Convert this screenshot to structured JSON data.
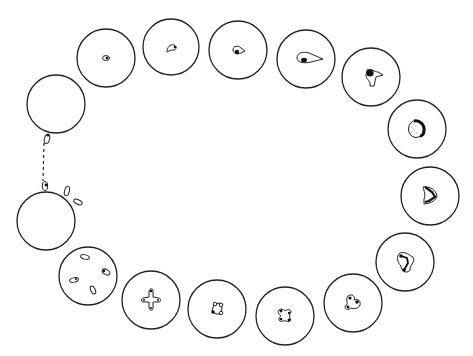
{
  "diagram": {
    "stroke_color": "#222222",
    "background": "#ffffff",
    "cells": [
      {
        "id": 1,
        "cx": 56,
        "cy": 104,
        "r": 29,
        "content": "empty-with-budding-body"
      },
      {
        "id": 2,
        "cx": 106,
        "cy": 58,
        "r": 29,
        "content": "small-nucleus"
      },
      {
        "id": 3,
        "cx": 171,
        "cy": 47,
        "r": 28,
        "content": "curved-nucleus"
      },
      {
        "id": 4,
        "cx": 238,
        "cy": 50,
        "r": 29,
        "content": "teardrop-nucleus"
      },
      {
        "id": 5,
        "cx": 306,
        "cy": 59,
        "r": 29,
        "content": "elongated-teardrop"
      },
      {
        "id": 6,
        "cx": 371,
        "cy": 77,
        "r": 29,
        "content": "trilobed-body"
      },
      {
        "id": 7,
        "cx": 417,
        "cy": 129,
        "r": 29,
        "content": "stippled-round-body"
      },
      {
        "id": 8,
        "cx": 430,
        "cy": 196,
        "r": 29,
        "content": "crescent-body"
      },
      {
        "id": 9,
        "cx": 405,
        "cy": 262,
        "r": 29,
        "content": "lobed-with-beads"
      },
      {
        "id": 10,
        "cx": 353,
        "cy": 303,
        "r": 29,
        "content": "trilobe-with-dots"
      },
      {
        "id": 11,
        "cx": 285,
        "cy": 316,
        "r": 29,
        "content": "x-shape-four-dots"
      },
      {
        "id": 12,
        "cx": 217,
        "cy": 309,
        "r": 29,
        "content": "square-four-dots"
      },
      {
        "id": 13,
        "cx": 151,
        "cy": 300,
        "r": 29,
        "content": "cross-shape"
      },
      {
        "id": 14,
        "cx": 88,
        "cy": 276,
        "r": 29,
        "content": "four-separate-bodies"
      },
      {
        "id": 15,
        "cx": 46,
        "cy": 221,
        "r": 29,
        "content": "empty-with-three-bodies"
      }
    ],
    "connector": {
      "type": "dashed",
      "x1": 44,
      "y1": 142,
      "x2": 43,
      "y2": 180
    }
  }
}
